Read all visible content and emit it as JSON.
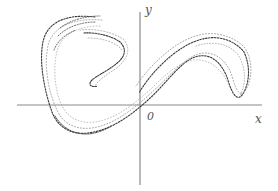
{
  "diagram": {
    "type": "phase-portrait",
    "colors": {
      "background": "#ffffff",
      "axis": "#8a8a8a",
      "points_dark": "#3a3a3a",
      "points_light": "#9a9a9a"
    },
    "axes": {
      "x_label": "x",
      "y_label": "y",
      "origin_label": "0"
    }
  }
}
